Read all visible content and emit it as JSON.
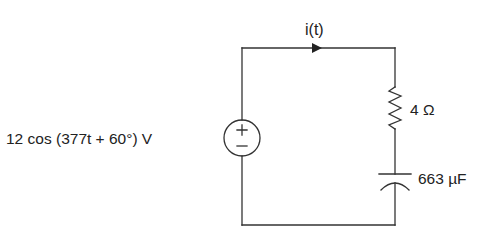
{
  "diagram": {
    "type": "series RC circuit",
    "colors": {
      "wire": "#333333",
      "text": "#222222",
      "background": "#ffffff"
    },
    "source": {
      "label": "12 cos (377t + 60°) V",
      "plus": "+",
      "minus": "−"
    },
    "current": {
      "label": "i(t)"
    },
    "resistor": {
      "label": "4 Ω"
    },
    "capacitor": {
      "label": "663 µF"
    }
  }
}
